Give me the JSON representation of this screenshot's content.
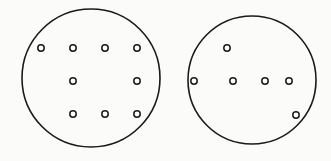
{
  "diagram": {
    "stroke_color": "#1a1a1a",
    "background": "#fbfbfa",
    "big_circles": [
      {
        "name": "left-circle",
        "cx": 91,
        "cy": 78,
        "r": 69,
        "dots": [
          {
            "x": 41,
            "y": 48
          },
          {
            "x": 73,
            "y": 48
          },
          {
            "x": 105,
            "y": 48
          },
          {
            "x": 137,
            "y": 48
          },
          {
            "x": 73,
            "y": 81
          },
          {
            "x": 137,
            "y": 81
          },
          {
            "x": 73,
            "y": 114
          },
          {
            "x": 105,
            "y": 114
          },
          {
            "x": 137,
            "y": 114
          }
        ]
      },
      {
        "name": "right-circle",
        "cx": 252,
        "cy": 80,
        "r": 64,
        "dots": [
          {
            "x": 227,
            "y": 48
          },
          {
            "x": 194,
            "y": 81
          },
          {
            "x": 233,
            "y": 81
          },
          {
            "x": 265,
            "y": 81
          },
          {
            "x": 289,
            "y": 81
          },
          {
            "x": 296,
            "y": 115
          }
        ]
      }
    ],
    "dot_radius": 3.2
  }
}
